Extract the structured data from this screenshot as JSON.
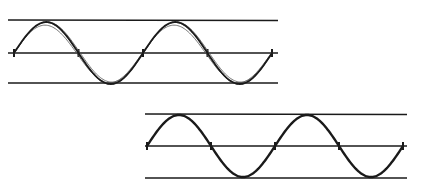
{
  "diagram": {
    "colors": {
      "background": "#ffffff",
      "ink": "#1a1a1a",
      "sketch": "#555555"
    },
    "panels": [
      {
        "id": "top-sine",
        "guides": {
          "x1": 8,
          "x2": 278,
          "top_y": 20,
          "mid_y": 53,
          "bottom_y": 83
        },
        "wave": {
          "x_start": 14,
          "x_end": 272,
          "cycles": 2,
          "mid_y": 53,
          "amplitude": 31
        },
        "style": "sketchy-overdrawn"
      },
      {
        "id": "bottom-sine",
        "guides": {
          "x1": 145,
          "x2": 407,
          "top_y": 114,
          "mid_y": 146,
          "bottom_y": 178
        },
        "wave": {
          "x_start": 147,
          "x_end": 403,
          "cycles": 2,
          "mid_y": 146,
          "amplitude": 31
        },
        "style": "clean"
      }
    ]
  }
}
